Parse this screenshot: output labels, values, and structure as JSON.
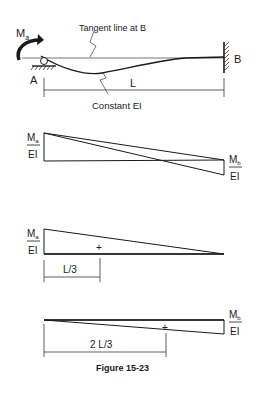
{
  "beam": {
    "moment_label": "M",
    "moment_sub": "a",
    "tangent_label": "Tangent line at B",
    "support_a_label": "A",
    "support_b_label": "B",
    "span_label": "L",
    "stiffness_label": "Constant EI"
  },
  "diagram1": {
    "left_num": "M",
    "left_sub": "a",
    "left_den": "EI",
    "right_num": "M",
    "right_sub": "b",
    "right_den": "EI"
  },
  "diagram2": {
    "left_num": "M",
    "left_sub": "a",
    "left_den": "EI",
    "centroid_mark": "+",
    "dim_label": "L/3"
  },
  "diagram3": {
    "right_num": "M",
    "right_sub": "b",
    "right_den": "EI",
    "centroid_mark": "+",
    "dim_label": "2 L/3"
  },
  "caption": "Figure 15-23"
}
